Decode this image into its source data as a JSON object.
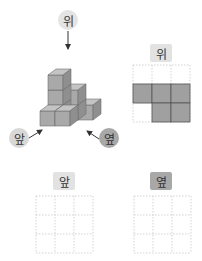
{
  "figure": {
    "solid": {
      "labels": {
        "top": "위",
        "front": "앞",
        "side": "옆"
      },
      "colors": {
        "top_label_bg": "#e4e4e4",
        "front_label_bg": "#d8d8d8",
        "side_label_bg": "#a8a8a8",
        "cube_front": "#a9a9a9",
        "cube_top": "#c4c4c4",
        "cube_side": "#8f8f8f",
        "cube_edge": "#6e6e6e",
        "arrow": "#333333"
      }
    },
    "views": [
      {
        "label": "위",
        "label_bg": "#e2e2e2",
        "grid": [
          [
            0,
            0,
            0
          ],
          [
            1,
            1,
            1
          ],
          [
            0,
            1,
            1
          ]
        ]
      },
      {
        "label": "앞",
        "label_bg": "#e2e2e2",
        "grid": [
          [
            0,
            0,
            0
          ],
          [
            0,
            0,
            0
          ],
          [
            0,
            0,
            0
          ]
        ]
      },
      {
        "label": "옆",
        "label_bg": "#a8a8a8",
        "grid": [
          [
            0,
            0,
            0
          ],
          [
            0,
            0,
            0
          ],
          [
            0,
            0,
            0
          ]
        ]
      }
    ],
    "grid_colors": {
      "filled": "#a0a0a0",
      "filled_edge": "#555555",
      "dotted": "#c8c8c8"
    }
  }
}
